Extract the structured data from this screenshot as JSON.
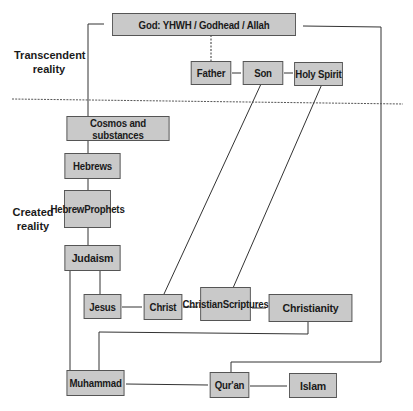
{
  "diagram": {
    "regions": {
      "transcendent": "Transcendent reality",
      "transcendent_lines": [
        "Transcendent",
        "reality"
      ],
      "created_lines": [
        "Created",
        "reality"
      ]
    },
    "nodes": {
      "god": "God: YHWH / Godhead / Allah",
      "father": "Father",
      "son": "Son",
      "holy_spirit": "Holy Spirit",
      "cosmos": "Cosmos and substances",
      "hebrews": "Hebrews",
      "hebrew_prophets_lines": [
        "Hebrew",
        "Prophets"
      ],
      "judaism": "Judaism",
      "jesus": "Jesus",
      "christ": "Christ",
      "christian_scriptures_lines": [
        "Christian",
        "Scriptures"
      ],
      "christianity": "Christianity",
      "muhammad": "Muhammad",
      "quran": "Qur'an",
      "islam": "Islam"
    },
    "edges": [
      [
        "god",
        "cosmos"
      ],
      [
        "god",
        "quran"
      ],
      [
        "god",
        "father",
        "dashed"
      ],
      [
        "father",
        "son"
      ],
      [
        "son",
        "holy_spirit"
      ],
      [
        "son",
        "christ"
      ],
      [
        "holy_spirit",
        "christian_scriptures"
      ],
      [
        "cosmos",
        "hebrews"
      ],
      [
        "hebrews",
        "hebrew_prophets"
      ],
      [
        "hebrew_prophets",
        "judaism"
      ],
      [
        "judaism",
        "jesus"
      ],
      [
        "judaism",
        "muhammad"
      ],
      [
        "jesus",
        "christ"
      ],
      [
        "christ",
        "christian_scriptures"
      ],
      [
        "christian_scriptures",
        "christianity"
      ],
      [
        "christianity",
        "muhammad"
      ],
      [
        "muhammad",
        "quran"
      ],
      [
        "quran",
        "islam"
      ]
    ]
  }
}
